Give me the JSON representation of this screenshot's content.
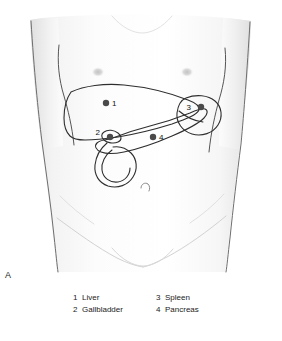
{
  "figure": {
    "panel_letter": "A",
    "view": "anterior-abdominal-surface-projection"
  },
  "legend": {
    "entries": [
      {
        "number": "1",
        "label": "Liver"
      },
      {
        "number": "3",
        "label": "Spleen"
      },
      {
        "number": "2",
        "label": "Gallbladder"
      },
      {
        "number": "4",
        "label": "Pancreas"
      }
    ]
  },
  "markers": [
    {
      "id": "1",
      "organ": "Liver",
      "number": "1",
      "dot_x": 106,
      "dot_y": 103,
      "num_x": 112,
      "num_y": 106
    },
    {
      "id": "2",
      "organ": "Gallbladder",
      "number": "2",
      "dot_x": 110,
      "dot_y": 137,
      "num_x": 100,
      "num_y": 135
    },
    {
      "id": "3",
      "organ": "Spleen",
      "number": "3",
      "dot_x": 201,
      "dot_y": 107,
      "num_x": 191,
      "num_y": 110
    },
    {
      "id": "4",
      "organ": "Pancreas",
      "number": "4",
      "dot_x": 153,
      "dot_y": 137,
      "num_x": 159,
      "num_y": 140
    }
  ],
  "colors": {
    "background": "#ffffff",
    "skin_fill": "#fbfbfb",
    "body_outline": "#4a4a4a",
    "organ_outline": "#2e2e2e",
    "marker_dot": "#4a4a4a",
    "text": "#232323",
    "nipple": "#cfcfcf"
  }
}
